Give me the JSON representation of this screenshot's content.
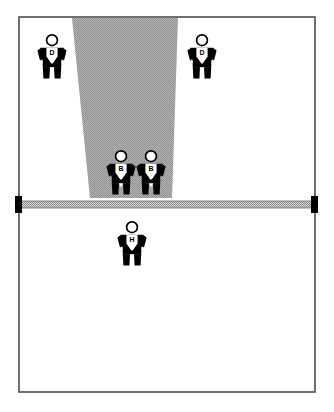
{
  "scene": {
    "title": "Volleyball court player positions diagram",
    "background_color": "#ffffff",
    "court": {
      "name": "court-outline",
      "border_color": "#4d4d4d",
      "fill_color": "#ffffff",
      "x": 19,
      "y": 17,
      "width": 296,
      "height": 375
    },
    "net": {
      "name": "net",
      "band_color": "#b3b3b3",
      "post_color": "#000000",
      "y": 201,
      "x_left": 19,
      "x_right": 315,
      "thickness": 7,
      "post_width": 7,
      "post_height": 17
    },
    "shaded_zone": {
      "name": "attack-cone-shading",
      "fill_color": "#a8a8a8",
      "description": "shaded trapezoidal attack cone from back of far court narrowing toward the net",
      "points": "72,18 178,18 172,198 90,198"
    },
    "players": [
      {
        "id": "p1",
        "label": "D",
        "role": "defender",
        "x": 52,
        "y": 56,
        "side": "far",
        "name": "player-d-left"
      },
      {
        "id": "p2",
        "label": "D",
        "role": "defender",
        "x": 202,
        "y": 56,
        "side": "far",
        "name": "player-d-right"
      },
      {
        "id": "p3",
        "label": "B",
        "role": "blocker",
        "x": 121,
        "y": 172,
        "side": "far",
        "name": "player-b-left"
      },
      {
        "id": "p4",
        "label": "B",
        "role": "blocker",
        "x": 151,
        "y": 172,
        "side": "far",
        "name": "player-b-right"
      },
      {
        "id": "p5",
        "label": "H",
        "role": "hitter",
        "x": 132,
        "y": 243,
        "side": "near",
        "name": "player-h"
      }
    ]
  }
}
